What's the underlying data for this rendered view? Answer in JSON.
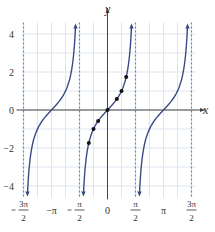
{
  "chart_data": {
    "type": "line",
    "title": "",
    "function": "y = tan x",
    "xlabel": "x",
    "ylabel": "y",
    "xlim": [
      -4.712,
      4.712
    ],
    "ylim": [
      -4.6,
      4.6
    ],
    "grid": true,
    "x_tick_labels": [
      {
        "value": -4.712,
        "num": "3π",
        "den": "2",
        "sign": "−"
      },
      {
        "value": -3.1416,
        "text": "−π"
      },
      {
        "value": -1.5708,
        "num": "π",
        "den": "2",
        "sign": "−"
      },
      {
        "value": 0,
        "text": "0"
      },
      {
        "value": 1.5708,
        "num": "π",
        "den": "2",
        "sign": ""
      },
      {
        "value": 3.1416,
        "text": "π"
      },
      {
        "value": 4.712,
        "num": "3π",
        "den": "2",
        "sign": ""
      }
    ],
    "y_tick_labels": [
      {
        "value": 4,
        "text": "4"
      },
      {
        "value": 2,
        "text": "2"
      },
      {
        "value": 0,
        "text": "0"
      },
      {
        "value": -2,
        "text": "−2"
      },
      {
        "value": -4,
        "text": "−4"
      }
    ],
    "asymptotes": [
      -4.712,
      -1.5708,
      1.5708,
      4.712
    ],
    "series": [
      {
        "name": "tan x",
        "color": "#3b4a86",
        "branches": [
          [
            -4.712,
            -1.5708
          ],
          [
            -1.5708,
            1.5708
          ],
          [
            1.5708,
            4.712
          ]
        ]
      }
    ],
    "points": [
      {
        "x": -1.0472,
        "y": -1.732
      },
      {
        "x": -0.7854,
        "y": -1.0
      },
      {
        "x": -0.5236,
        "y": -0.577
      },
      {
        "x": 0,
        "y": 0
      },
      {
        "x": 0.5236,
        "y": 0.577
      },
      {
        "x": 0.7854,
        "y": 1.0
      },
      {
        "x": 1.0472,
        "y": 1.732
      }
    ],
    "colors": {
      "curve": "#3b4a86",
      "asymptote": "#4a90d9",
      "grid": "#dde6ef",
      "axis": "#444444"
    }
  }
}
